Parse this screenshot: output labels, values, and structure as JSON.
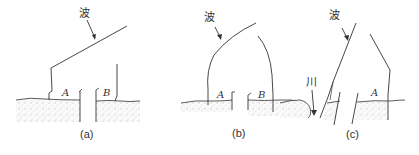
{
  "panels": [
    {
      "caption": "(a)",
      "wave_label": "波",
      "region_labels": [
        "A",
        "B"
      ]
    },
    {
      "caption": "(b)",
      "wave_label": "波",
      "region_labels": [
        "A",
        "B"
      ]
    },
    {
      "caption": "(c)",
      "wave_label": "波",
      "river_label": "川",
      "region_labels": [
        "A"
      ]
    }
  ],
  "colors": {
    "line": "#333333",
    "ground_dots": "#9a9a9a",
    "background": "#ffffff"
  }
}
